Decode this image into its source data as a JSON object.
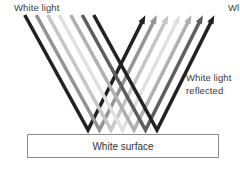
{
  "diagram": {
    "background": "#ffffff",
    "labels": {
      "incident": "White light",
      "truncated_top_right": "Wl",
      "reflected_line1": "White light",
      "reflected_line2": "reflected",
      "surface": "White surface"
    },
    "colors": {
      "text": "#3a3a3a",
      "box_border": "#8c8c8c",
      "box_fill": "#ffffff"
    },
    "rays": {
      "description": "Seven parallel rays of white light (grayscale spectrum shades) descend from upper-left, bounce off the white surface, and reflect up to the upper-right ending in arrowheads.",
      "shades": [
        "#222222",
        "#949494",
        "#c6c6c6",
        "#e0e0e0",
        "#b0b0b0",
        "#5e5e5e",
        "#222222"
      ],
      "bounce_xs": [
        88,
        99.5,
        111,
        122.5,
        134,
        145.5,
        157
      ],
      "bounce_y": 130,
      "incident_top_y": 15,
      "incident_dxdy": 0.55,
      "reflected_top_y": 22,
      "reflected_dxdy": 0.5,
      "stroke_width": 3.6,
      "arrowhead_length": 7.5,
      "arrowhead_half_width": 3.4
    }
  }
}
